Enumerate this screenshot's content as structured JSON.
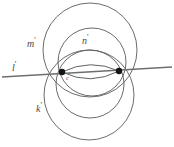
{
  "figure": {
    "background_color": "#ffffff",
    "stroke_color": "#5a5a5a",
    "line_color": "#6e6e6e",
    "point_color": "#1a1a1a",
    "width": 174,
    "height": 147,
    "labels": {
      "m": {
        "text": "m",
        "prime": "'"
      },
      "n": {
        "text": "n",
        "prime": "'"
      },
      "k": {
        "text": "k",
        "prime": "'"
      },
      "l": {
        "text": "l",
        "prime": "'"
      },
      "c": {
        "text": "c",
        "prime": "'"
      }
    },
    "points": [
      {
        "name": "left-intersection",
        "x": 62,
        "y": 72
      },
      {
        "name": "right-intersection",
        "x": 119,
        "y": 71
      }
    ],
    "line": {
      "name": "line-l",
      "x1": 2,
      "y1": 77,
      "x2": 172,
      "y2": 67
    },
    "circles": [
      {
        "name": "circle-m-large-top",
        "cx": 90,
        "cy": 50,
        "r": 47
      },
      {
        "name": "circle-n-mid-top",
        "cx": 92,
        "cy": 62,
        "r": 34
      },
      {
        "name": "circle-k-large-bottom",
        "cx": 89,
        "cy": 95,
        "r": 45
      },
      {
        "name": "circle-bottom-mid",
        "cx": 90,
        "cy": 84,
        "r": 34
      }
    ],
    "lens_arcs": [
      {
        "name": "lens-arc-upper",
        "from": [
          62,
          72
        ],
        "to": [
          119,
          71
        ],
        "bulge": -14
      },
      {
        "name": "lens-arc-lower",
        "from": [
          62,
          72
        ],
        "to": [
          119,
          71
        ],
        "bulge": 14
      }
    ]
  }
}
